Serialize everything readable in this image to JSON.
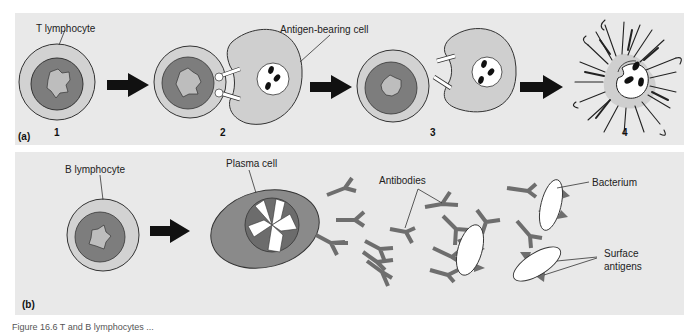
{
  "figure": {
    "panels": [
      {
        "id": "a",
        "label": "(a)",
        "steps": [
          {
            "number": "1",
            "description": "T lymphocyte"
          },
          {
            "number": "2",
            "description": "T lymphocyte binds antigen-bearing cell"
          },
          {
            "number": "3",
            "description": "T lymphocyte detaches from antigen-bearing cell"
          },
          {
            "number": "4",
            "description": "Antigen-bearing cell lyses"
          }
        ],
        "callouts": {
          "t_lymphocyte": "T lymphocyte",
          "antigen_bearing_cell": "Antigen-bearing cell"
        }
      },
      {
        "id": "b",
        "label": "(b)",
        "callouts": {
          "b_lymphocyte": "B lymphocyte",
          "plasma_cell": "Plasma cell",
          "antibodies": "Antibodies",
          "bacterium": "Bacterium",
          "surface_antigens_line1": "Surface",
          "surface_antigens_line2": "antigens"
        }
      }
    ],
    "caption": "Figure 16.6  T and B lymphocytes ..."
  },
  "colors": {
    "panel_bg": "#e9e9e9",
    "cell_outer": "#cfcfcf",
    "cell_inner": "#7d7d7d",
    "nucleus": "#b9b9b9",
    "antibody": "#6e6e6e",
    "arrow": "#111111",
    "outline": "#333333"
  },
  "icons": [
    "arrow-right-icon"
  ]
}
